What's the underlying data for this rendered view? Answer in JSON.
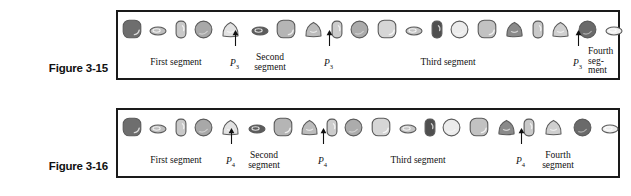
{
  "figures": [
    {
      "id": "figure-3-15",
      "caption": "Figure 3-15",
      "segment_labels": [
        {
          "text": "First segment",
          "x": 58,
          "y": 12,
          "mode": "single"
        },
        {
          "text": "Second segment",
          "x": 152,
          "y": 7,
          "mode": "two-line"
        },
        {
          "text": "Third segment",
          "x": 330,
          "y": 12,
          "mode": "single"
        },
        {
          "text": "Fourth seg- ment",
          "x": 470,
          "y": 1,
          "mode": "three-line"
        }
      ],
      "p_markers": [
        {
          "label": "P",
          "sub": "3",
          "x": 112,
          "y": 12
        },
        {
          "label": "P",
          "sub": "3",
          "x": 206,
          "y": 12
        },
        {
          "label": "P",
          "sub": "3",
          "x": 455,
          "y": 12
        }
      ],
      "arrows": [
        {
          "x": 114,
          "y": -16,
          "height": 16
        },
        {
          "x": 208,
          "y": -16,
          "height": 16
        },
        {
          "x": 457,
          "y": -16,
          "height": 16
        }
      ],
      "organisms": [
        {
          "shape": "rounded-square",
          "fill": "#6e6e6e",
          "w": 20,
          "h": 20,
          "x": 4,
          "y": 3
        },
        {
          "shape": "ellipse",
          "fill": "#bdbdbd",
          "w": 18,
          "h": 10,
          "x": 31,
          "y": 10
        },
        {
          "shape": "capsule",
          "fill": "#c9c9c9",
          "w": 12,
          "h": 19,
          "x": 57,
          "y": 4
        },
        {
          "shape": "circle",
          "fill": "#a8a8a8",
          "w": 19,
          "h": 19,
          "x": 76,
          "y": 4
        },
        {
          "shape": "triangle",
          "fill": "#e2e2e2",
          "w": 19,
          "h": 17,
          "x": 103,
          "y": 5
        },
        {
          "shape": "ellipse",
          "fill": "#5c5c5c",
          "w": 18,
          "h": 10,
          "x": 133,
          "y": 10
        },
        {
          "shape": "rounded-square",
          "fill": "#b5b5b5",
          "w": 20,
          "h": 20,
          "x": 158,
          "y": 3
        },
        {
          "shape": "triangle",
          "fill": "#bcbcbc",
          "w": 19,
          "h": 17,
          "x": 186,
          "y": 5
        },
        {
          "shape": "capsule",
          "fill": "#cccccc",
          "w": 12,
          "h": 19,
          "x": 213,
          "y": 4
        },
        {
          "shape": "circle",
          "fill": "#acacac",
          "w": 19,
          "h": 19,
          "x": 232,
          "y": 4
        },
        {
          "shape": "rounded-square",
          "fill": "#d6d6d6",
          "w": 20,
          "h": 20,
          "x": 259,
          "y": 3
        },
        {
          "shape": "ellipse",
          "fill": "#c4c4c4",
          "w": 18,
          "h": 10,
          "x": 287,
          "y": 10
        },
        {
          "shape": "capsule",
          "fill": "#4f4f4f",
          "w": 12,
          "h": 19,
          "x": 313,
          "y": 4
        },
        {
          "shape": "circle",
          "fill": "#ececec",
          "w": 19,
          "h": 19,
          "x": 332,
          "y": 4
        },
        {
          "shape": "rounded-square",
          "fill": "#c2c2c2",
          "w": 20,
          "h": 20,
          "x": 359,
          "y": 3
        },
        {
          "shape": "triangle",
          "fill": "#8a8a8a",
          "w": 19,
          "h": 17,
          "x": 387,
          "y": 5
        },
        {
          "shape": "capsule",
          "fill": "#c9c9c9",
          "w": 12,
          "h": 19,
          "x": 414,
          "y": 4
        },
        {
          "shape": "triangle",
          "fill": "#cfcfcf",
          "w": 19,
          "h": 17,
          "x": 433,
          "y": 5
        },
        {
          "shape": "circle",
          "fill": "#6a6a6a",
          "w": 19,
          "h": 19,
          "x": 460,
          "y": 4
        },
        {
          "shape": "ellipse",
          "fill": "#ededed",
          "w": 18,
          "h": 10,
          "x": 487,
          "y": 10
        }
      ]
    },
    {
      "id": "figure-3-16",
      "caption": "Figure 3-16",
      "segment_labels": [
        {
          "text": "First segment",
          "x": 58,
          "y": 12,
          "mode": "single"
        },
        {
          "text": "Second segment",
          "x": 146,
          "y": 7,
          "mode": "two-line"
        },
        {
          "text": "Third segment",
          "x": 300,
          "y": 12,
          "mode": "single"
        },
        {
          "text": "Fourth segment",
          "x": 440,
          "y": 7,
          "mode": "two-line"
        }
      ],
      "p_markers": [
        {
          "label": "P",
          "sub": "4",
          "x": 108,
          "y": 12
        },
        {
          "label": "P",
          "sub": "4",
          "x": 200,
          "y": 12
        },
        {
          "label": "P",
          "sub": "4",
          "x": 398,
          "y": 12
        }
      ],
      "arrows": [
        {
          "x": 110,
          "y": -16,
          "height": 16
        },
        {
          "x": 202,
          "y": -16,
          "height": 16
        },
        {
          "x": 400,
          "y": -16,
          "height": 16
        }
      ],
      "organisms": [
        {
          "shape": "rounded-square",
          "fill": "#6e6e6e",
          "w": 20,
          "h": 20,
          "x": 4,
          "y": 3
        },
        {
          "shape": "ellipse",
          "fill": "#bdbdbd",
          "w": 18,
          "h": 10,
          "x": 31,
          "y": 10
        },
        {
          "shape": "capsule",
          "fill": "#c9c9c9",
          "w": 12,
          "h": 19,
          "x": 57,
          "y": 4
        },
        {
          "shape": "circle",
          "fill": "#a8a8a8",
          "w": 19,
          "h": 19,
          "x": 76,
          "y": 4
        },
        {
          "shape": "triangle",
          "fill": "#e2e2e2",
          "w": 19,
          "h": 17,
          "x": 103,
          "y": 5
        },
        {
          "shape": "ellipse",
          "fill": "#5c5c5c",
          "w": 18,
          "h": 10,
          "x": 130,
          "y": 10
        },
        {
          "shape": "rounded-square",
          "fill": "#b5b5b5",
          "w": 20,
          "h": 20,
          "x": 155,
          "y": 3
        },
        {
          "shape": "triangle",
          "fill": "#bcbcbc",
          "w": 19,
          "h": 17,
          "x": 182,
          "y": 5
        },
        {
          "shape": "capsule",
          "fill": "#cccccc",
          "w": 12,
          "h": 19,
          "x": 208,
          "y": 4
        },
        {
          "shape": "circle",
          "fill": "#acacac",
          "w": 19,
          "h": 19,
          "x": 226,
          "y": 4
        },
        {
          "shape": "rounded-square",
          "fill": "#d6d6d6",
          "w": 20,
          "h": 20,
          "x": 253,
          "y": 3
        },
        {
          "shape": "ellipse",
          "fill": "#c4c4c4",
          "w": 18,
          "h": 10,
          "x": 281,
          "y": 10
        },
        {
          "shape": "capsule",
          "fill": "#4f4f4f",
          "w": 12,
          "h": 19,
          "x": 306,
          "y": 4
        },
        {
          "shape": "circle",
          "fill": "#ececec",
          "w": 19,
          "h": 19,
          "x": 324,
          "y": 4
        },
        {
          "shape": "rounded-square",
          "fill": "#c2c2c2",
          "w": 20,
          "h": 20,
          "x": 351,
          "y": 3
        },
        {
          "shape": "triangle",
          "fill": "#8a8a8a",
          "w": 19,
          "h": 17,
          "x": 379,
          "y": 5
        },
        {
          "shape": "capsule",
          "fill": "#c9c9c9",
          "w": 12,
          "h": 19,
          "x": 405,
          "y": 4
        },
        {
          "shape": "triangle",
          "fill": "#cfcfcf",
          "w": 19,
          "h": 17,
          "x": 426,
          "y": 5
        },
        {
          "shape": "circle",
          "fill": "#6a6a6a",
          "w": 19,
          "h": 19,
          "x": 455,
          "y": 4
        },
        {
          "shape": "ellipse",
          "fill": "#ededed",
          "w": 18,
          "h": 10,
          "x": 483,
          "y": 10
        }
      ]
    }
  ],
  "colors": {
    "border": "#1a1a1a",
    "text": "#111111",
    "background": "#ffffff",
    "outline": "#5a5a5a"
  }
}
